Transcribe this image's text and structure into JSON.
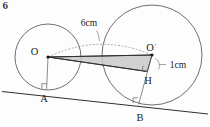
{
  "figure": {
    "corner_mark": "6",
    "caption": "",
    "points": {
      "O": {
        "label": "O",
        "x": 48,
        "y": 57
      },
      "Oprime": {
        "label": "O",
        "prime": "′",
        "x": 152,
        "y": 55
      },
      "A": {
        "label": "A",
        "x": 47,
        "y": 89
      },
      "B": {
        "label": "B",
        "x": 139,
        "y": 104
      },
      "H": {
        "label": "H",
        "x": 148,
        "y": 68
      }
    },
    "dimensions": {
      "arc_label": "6cm",
      "gap_label": "1cm"
    },
    "colors": {
      "shaded_fill": "#c9c9c9",
      "stroke": "#4a4a4a",
      "line": "#2f2f2f",
      "dashed": "#8a8a8a",
      "text": "#1a1a1a"
    },
    "geometry": {
      "circle_left": {
        "cx": 48,
        "cy": 57,
        "r": 33
      },
      "circle_right": {
        "cx": 152,
        "cy": 55,
        "r": 50
      },
      "tangent_line": {
        "x1": 3,
        "y1": 92,
        "x2": 207,
        "y2": 114
      },
      "radius_OA": {
        "x1": 48,
        "y1": 57,
        "x2": 47,
        "y2": 89
      },
      "radius_OpB": {
        "x1": 152,
        "y1": 55,
        "x2": 139,
        "y2": 104
      },
      "center_line": {
        "x1": 48,
        "y1": 57,
        "x2": 152,
        "y2": 55
      },
      "dashed_arc": "M48,57 Q100,33 152,55",
      "shaded_polygon": "48,57 152,55 147.5,71 48,57"
    }
  }
}
